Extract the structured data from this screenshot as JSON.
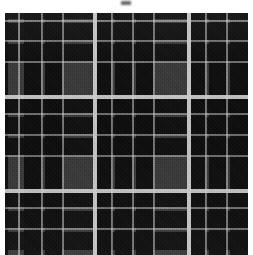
{
  "image": {
    "kind": "textile-swatch",
    "pattern_name": "tartan-plaid",
    "width_px": 253,
    "height_px": 255,
    "alt_text": ""
  },
  "artifact": {
    "name": "scan-smudge",
    "label": ""
  },
  "palette": {
    "page_background": "#ffffff",
    "border": "#ffffff",
    "field_gray": "#3a3a3a",
    "block_black": "#0d0d0d",
    "stripe_bright": "#d0d0d0",
    "stripe_faint": "#c6c6c6"
  },
  "layers": {
    "field": {
      "label": ""
    },
    "warp_dark": {
      "label": ""
    },
    "weft_dark": {
      "label": ""
    },
    "warp_light": {
      "label": ""
    },
    "weft_light": {
      "label": ""
    },
    "weave": {
      "label": ""
    },
    "grain": {
      "label": ""
    },
    "vignette": {
      "label": ""
    }
  },
  "geometry": {
    "border_px": 5,
    "sett_repeat_px": 94,
    "bright_warp_lines_px": [
      90,
      184
    ],
    "bright_weft_lines_px": [
      84,
      178
    ],
    "faint_warp_lines_px": [
      14,
      37,
      58,
      107,
      128,
      149,
      201,
      222
    ],
    "faint_weft_lines_px": [
      8,
      28,
      49,
      101,
      122,
      143,
      195,
      216
    ],
    "dark_warp_bands_px": [
      [
        19,
        36
      ],
      [
        40,
        57
      ],
      [
        92,
        106
      ],
      [
        110,
        127
      ],
      [
        131,
        148
      ],
      [
        186,
        200
      ],
      [
        204,
        221
      ],
      [
        225,
        243
      ]
    ],
    "dark_weft_bands_px": [
      [
        0,
        6
      ],
      [
        10,
        27
      ],
      [
        31,
        48
      ],
      [
        86,
        100
      ],
      [
        104,
        121
      ],
      [
        125,
        142
      ],
      [
        180,
        194
      ],
      [
        198,
        215
      ],
      [
        219,
        237
      ]
    ]
  }
}
